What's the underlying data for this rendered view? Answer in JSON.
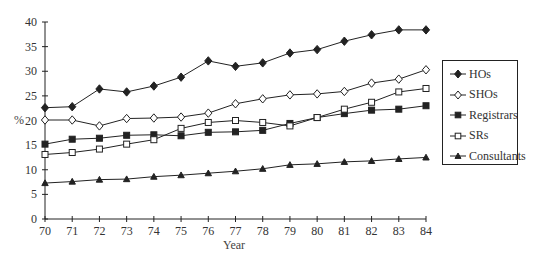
{
  "chart_data": {
    "type": "line",
    "title": "",
    "xlabel": "Year",
    "ylabel": "%",
    "x": [
      70,
      71,
      72,
      73,
      74,
      75,
      76,
      77,
      78,
      79,
      80,
      81,
      82,
      83,
      84
    ],
    "xlim": [
      70,
      84
    ],
    "ylim": [
      0,
      40
    ],
    "yticks": [
      0,
      5,
      10,
      15,
      20,
      25,
      30,
      35,
      40
    ],
    "grid": false,
    "legend_position": "right",
    "series": [
      {
        "name": "HOs",
        "marker": "filled-diamond",
        "values": [
          22.6,
          22.8,
          26.4,
          25.8,
          27.0,
          28.8,
          32.1,
          31.0,
          31.7,
          33.7,
          34.4,
          36.1,
          37.4,
          38.4,
          38.4
        ]
      },
      {
        "name": "SHOs",
        "marker": "open-diamond",
        "values": [
          20.1,
          20.1,
          18.9,
          20.4,
          20.5,
          20.7,
          21.5,
          23.4,
          24.4,
          25.2,
          25.4,
          25.9,
          27.6,
          28.4,
          30.3
        ]
      },
      {
        "name": "Registrars",
        "marker": "filled-square",
        "values": [
          15.2,
          16.2,
          16.4,
          17.0,
          17.1,
          16.9,
          17.6,
          17.7,
          18.0,
          19.4,
          20.6,
          21.4,
          22.1,
          22.3,
          23.0
        ]
      },
      {
        "name": "SRs",
        "marker": "open-square",
        "values": [
          13.1,
          13.5,
          14.2,
          15.2,
          16.1,
          18.4,
          19.6,
          20.0,
          19.6,
          18.9,
          20.6,
          22.3,
          23.7,
          25.8,
          26.5
        ]
      },
      {
        "name": "Consultants",
        "marker": "filled-triangle",
        "values": [
          7.3,
          7.6,
          8.0,
          8.1,
          8.6,
          8.9,
          9.3,
          9.7,
          10.2,
          11.0,
          11.2,
          11.6,
          11.8,
          12.2,
          12.5
        ]
      }
    ]
  },
  "axes": {
    "ylabel": "%",
    "xlabel": "Year"
  },
  "legend": {
    "items": [
      {
        "label": "HOs"
      },
      {
        "label": "SHOs"
      },
      {
        "label": "Registrars"
      },
      {
        "label": "SRs"
      },
      {
        "label": "Consultants"
      }
    ]
  },
  "colors": {
    "line": "#222222",
    "axis": "#222222",
    "background": "#ffffff"
  }
}
